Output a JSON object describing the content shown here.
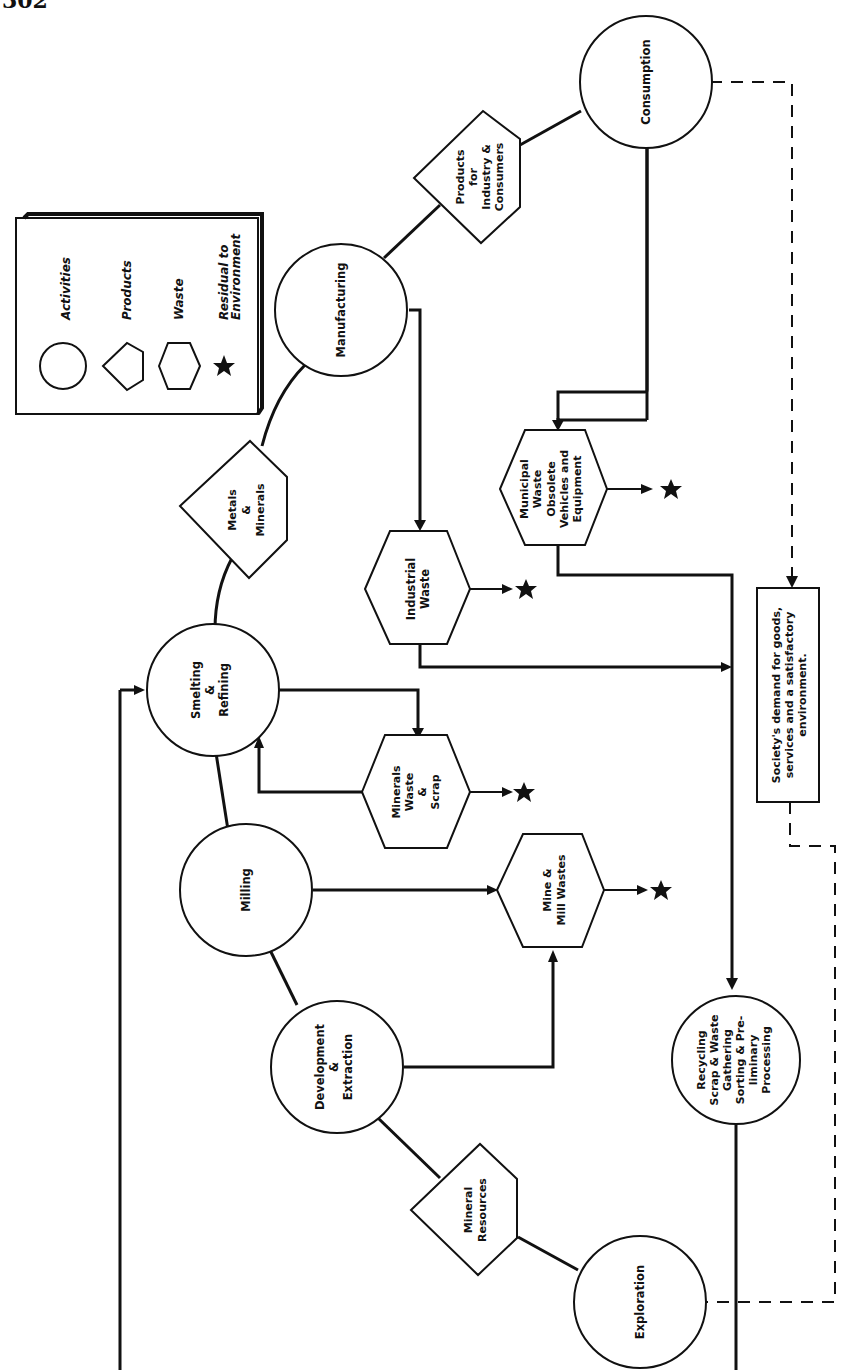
{
  "page": {
    "number": "302"
  },
  "legend": {
    "items": [
      {
        "shape": "circle",
        "label": "Activities"
      },
      {
        "shape": "pentagon",
        "label": "Products"
      },
      {
        "shape": "hexagon",
        "label": "Waste"
      },
      {
        "shape": "star",
        "label_line1": "Residual to",
        "label_line2": "Environment"
      }
    ]
  },
  "activities": {
    "consumption": {
      "lines": [
        "Consumption"
      ]
    },
    "manufacturing": {
      "lines": [
        "Manufacturing"
      ]
    },
    "smelting": {
      "lines": [
        "Smelting",
        "&",
        "Refining"
      ]
    },
    "milling": {
      "lines": [
        "Milling"
      ]
    },
    "development": {
      "lines": [
        "Development",
        "&",
        "Extraction"
      ]
    },
    "exploration": {
      "lines": [
        "Exploration"
      ]
    },
    "recycling": {
      "lines": [
        "Recycling",
        "Scrap & Waste",
        "Gathering",
        "Sorting & Pre-",
        "liminary",
        "Processing"
      ]
    }
  },
  "products": {
    "products_for_industry": {
      "lines": [
        "Products",
        "for",
        "Industry &",
        "Consumers"
      ]
    },
    "metals_minerals": {
      "lines": [
        "Metals",
        "&",
        "Minerals"
      ]
    },
    "mineral_resources": {
      "lines": [
        "Mineral",
        "Resources"
      ]
    }
  },
  "wastes": {
    "municipal": {
      "lines": [
        "Municipal",
        "Waste",
        "Obsolete",
        "Vehicles and",
        "Equipment"
      ]
    },
    "industrial": {
      "lines": [
        "Industrial",
        "Waste"
      ]
    },
    "minerals_scrap": {
      "lines": [
        "Minerals",
        "Waste",
        "&",
        "Scrap"
      ]
    },
    "mine_mill": {
      "lines": [
        "Mine &",
        "Mill Wastes"
      ]
    }
  },
  "society_box": {
    "lines": [
      "Society's demand for goods,",
      "services and a satisfactory",
      "environment."
    ]
  },
  "colors": {
    "ink": "#111111",
    "paper": "#ffffff"
  }
}
